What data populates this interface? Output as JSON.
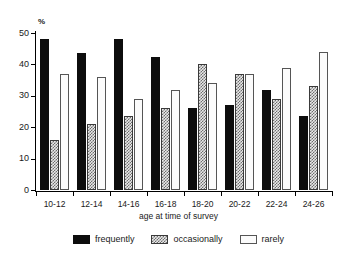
{
  "chart_data": {
    "type": "bar",
    "title": "",
    "xlabel": "age at time of survey",
    "ylabel": "%",
    "ylim": [
      0,
      50
    ],
    "yticks": [
      0,
      10,
      20,
      30,
      40,
      50
    ],
    "grid": false,
    "legend_position": "bottom",
    "categories": [
      "10-12",
      "12-14",
      "14-16",
      "16-18",
      "18-20",
      "20-22",
      "22-24",
      "24-26"
    ],
    "series": [
      {
        "name": "frequently",
        "color": "#0d0d0d",
        "pattern": "solid",
        "values": [
          48,
          43.5,
          48,
          42.5,
          26,
          27,
          32,
          23.5
        ]
      },
      {
        "name": "occasionally",
        "color": "#6e6e6e",
        "pattern": "hatched",
        "values": [
          16,
          21,
          23.5,
          26,
          40,
          37,
          29,
          33
        ]
      },
      {
        "name": "rarely",
        "color": "#fbfbfb",
        "pattern": "open",
        "values": [
          37,
          36,
          29,
          32,
          34,
          37,
          39,
          44
        ]
      }
    ]
  },
  "axis": {
    "y_unit_label": "%",
    "tick_labels_y": [
      "0",
      "10",
      "20",
      "30",
      "40",
      "50"
    ],
    "x_title": "age at time of survey"
  },
  "legend": {
    "items": [
      {
        "label": "frequently"
      },
      {
        "label": "occasionally"
      },
      {
        "label": "rarely"
      }
    ]
  }
}
